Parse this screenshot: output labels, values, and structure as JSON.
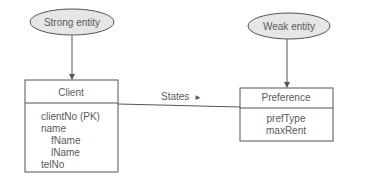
{
  "diagram": {
    "type": "er-diagram",
    "annotations": [
      {
        "id": "strong",
        "label": "Strong entity",
        "points_to": "client"
      },
      {
        "id": "weak",
        "label": "Weak entity",
        "points_to": "preference"
      }
    ],
    "entities": [
      {
        "id": "client",
        "name": "Client",
        "attributes": [
          "clientNo (PK)",
          "name",
          "fName",
          "lName",
          "telNo"
        ]
      },
      {
        "id": "preference",
        "name": "Preference",
        "attributes": [
          "prefType",
          "maxRent"
        ]
      }
    ],
    "relationship": {
      "label": "States",
      "direction_marker": "►",
      "from": "client",
      "to": "preference"
    },
    "colors": {
      "ellipse_fill": "#e6e6e6",
      "stroke": "#555555",
      "text": "#5a5a5a"
    }
  }
}
